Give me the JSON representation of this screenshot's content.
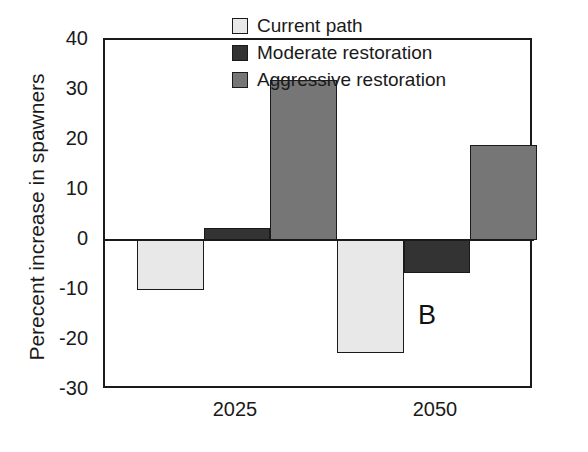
{
  "chart_data": {
    "type": "bar",
    "title": "",
    "panel_label": "B",
    "xlabel": "",
    "ylabel": "Perecent increase in spawners",
    "categories": [
      "2025",
      "2050"
    ],
    "series": [
      {
        "name": "Current path",
        "color": "#e8e8e8",
        "values": [
          -10,
          -22.5
        ]
      },
      {
        "name": "Moderate restoration",
        "color": "#333333",
        "values": [
          2.5,
          -6.5
        ]
      },
      {
        "name": "Aggressive restoration",
        "color": "#767676",
        "values": [
          32,
          19
        ]
      }
    ],
    "ylim": [
      -30,
      40
    ],
    "ytick_labels": [
      "40",
      "30",
      "20",
      "10",
      "0",
      "-10",
      "-20",
      "-30"
    ],
    "ytick_values": [
      40,
      30,
      20,
      10,
      0,
      -10,
      -20,
      -30
    ],
    "grid": false,
    "legend_position": "top-right",
    "axis_color": "#1a1a1a",
    "background_color": "#ffffff"
  }
}
